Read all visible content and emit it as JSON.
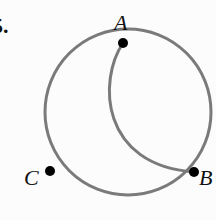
{
  "problem_number": "5.",
  "colors": {
    "curve": "#7a7a7a",
    "point": "#000000",
    "text": "#111111",
    "background": "#fcfcfc"
  },
  "diagram": {
    "circle": {
      "cx": 128,
      "cy": 112,
      "r": 83
    },
    "points": [
      {
        "label": "A",
        "x": 123,
        "y": 43
      },
      {
        "label": "B",
        "x": 194,
        "y": 172
      },
      {
        "label": "C",
        "x": 50,
        "y": 171
      }
    ],
    "inner_arc": {
      "from": "A",
      "to": "B"
    }
  }
}
